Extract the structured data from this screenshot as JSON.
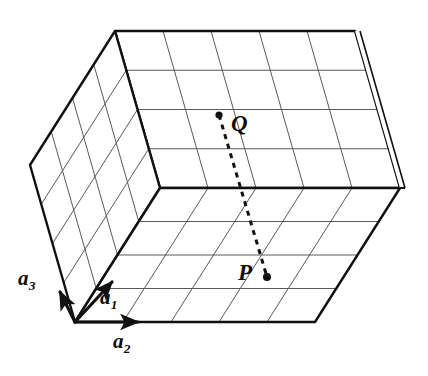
{
  "figure": {
    "kind": "lattice-parallelepiped",
    "background_color": "#ffffff",
    "ink_color": "#111111",
    "grid_line_color": "#555555",
    "edge_line_color": "#111111"
  },
  "labels": {
    "axis_a1": {
      "base": "a",
      "subscript": "1"
    },
    "axis_a2": {
      "base": "a",
      "subscript": "2"
    },
    "axis_a3": {
      "base": "a",
      "subscript": "3"
    },
    "point_P": "P",
    "point_Q": "Q"
  },
  "vectors": [
    {
      "name": "a1",
      "label": "a1",
      "from": [
        75,
        322
      ],
      "to": [
        114,
        280
      ],
      "style": "solid-arrow",
      "width": 3.2
    },
    {
      "name": "a2",
      "label": "a2",
      "from": [
        75,
        322
      ],
      "to": [
        142,
        322
      ],
      "style": "solid-arrow",
      "width": 3.2
    },
    {
      "name": "a3",
      "label": "a3",
      "from": [
        75,
        322
      ],
      "to": [
        60,
        290
      ],
      "style": "solid-arrow",
      "width": 3.2
    }
  ],
  "geometry": {
    "origin": [
      75,
      322
    ],
    "edge_a1": [
      85,
      -134
    ],
    "edge_a2": [
      240,
      0
    ],
    "edge_a3": [
      -45,
      -157
    ],
    "divisions": {
      "n1": 4,
      "n2": 5,
      "n3": 4
    },
    "vertices": {
      "O_front_bottom_left": [
        75,
        322
      ],
      "front_bottom_right": [
        315,
        322
      ],
      "front_top_left": [
        160,
        188
      ],
      "front_top_right": [
        400,
        188
      ],
      "back_bottom_left": [
        30,
        165
      ],
      "back_top_left": [
        115,
        31
      ],
      "back_top_right": [
        355,
        31
      ],
      "right_mid": [
        405,
        188
      ]
    }
  },
  "points": [
    {
      "name": "Q",
      "label": "Q",
      "dot": [
        219,
        115
      ],
      "label_pos": [
        231,
        112
      ],
      "face": "top"
    },
    {
      "name": "P",
      "label": "P",
      "dot": [
        267,
        277
      ],
      "label_pos": [
        238,
        261
      ],
      "face": "front"
    }
  ],
  "connector": {
    "name": "PQ-dashed-line",
    "from": [
      219,
      115
    ],
    "to": [
      267,
      277
    ],
    "style": "dashed",
    "dash_pattern": "5 5",
    "width": 3
  },
  "faces": [
    {
      "name": "top-face",
      "rows": 4,
      "cols": 5,
      "visible": true
    },
    {
      "name": "front-face",
      "rows": 4,
      "cols": 5,
      "visible": true
    },
    {
      "name": "left-face",
      "rows": 4,
      "cols": 4,
      "visible": true
    }
  ]
}
